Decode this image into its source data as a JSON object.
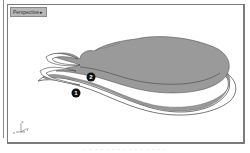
{
  "viewport": {
    "tab_label": "Perspective",
    "tab_menu_icon": "triangle-down-icon"
  },
  "callouts": [
    {
      "number": "1",
      "label": "lower surface edge"
    },
    {
      "number": "2",
      "label": "upper surface edge"
    }
  ],
  "axis_widget": {
    "x_label": "x",
    "y_label": "y",
    "z_label": "z"
  },
  "caption": {
    "text": "· · · · · · · · · · · · · · ·"
  },
  "colors": {
    "shape_fill": "#9a9a9a",
    "shape_edge": "#555555",
    "border": "#7a7a7a",
    "tab_bg": "#b8b8b8",
    "callout_bg": "#111111",
    "callout_text": "#ffffff"
  }
}
